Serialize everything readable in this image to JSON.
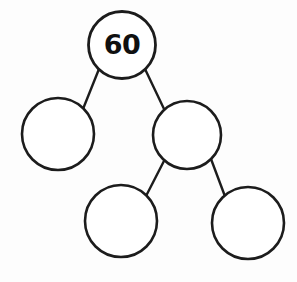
{
  "diagram": {
    "type": "number-bond",
    "background_color": "#fdfdfd",
    "stroke_color": "#1c1c1c",
    "fill_color": "#ffffff",
    "text_color": "#101010",
    "nodes": [
      {
        "id": "root",
        "label": "60",
        "cx": 122,
        "cy": 45,
        "r": 33.5,
        "filled": false
      },
      {
        "id": "left-child",
        "label": "",
        "cx": 58,
        "cy": 134,
        "r": 36,
        "filled": false
      },
      {
        "id": "right-child",
        "label": "",
        "cx": 187,
        "cy": 135,
        "r": 34,
        "filled": false
      },
      {
        "id": "bottom-left-child",
        "label": "",
        "cx": 121,
        "cy": 221,
        "r": 36,
        "filled": false
      },
      {
        "id": "bottom-right-child",
        "label": "",
        "cx": 248,
        "cy": 223,
        "r": 36,
        "filled": false
      }
    ],
    "edges": [
      {
        "id": "root-to-left",
        "x1": 99,
        "y1": 69,
        "x2": 83,
        "y2": 109
      },
      {
        "id": "root-to-right",
        "x1": 145,
        "y1": 69,
        "x2": 165,
        "y2": 111
      },
      {
        "id": "right-to-bottom-left",
        "x1": 165,
        "y1": 159,
        "x2": 145,
        "y2": 198
      },
      {
        "id": "right-to-bottom-right",
        "x1": 211,
        "y1": 159,
        "x2": 226,
        "y2": 199
      }
    ]
  }
}
